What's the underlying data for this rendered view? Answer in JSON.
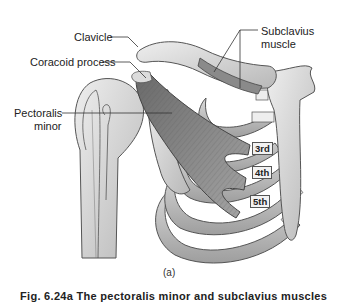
{
  "figure": {
    "labels": {
      "clavicle": "Clavicle",
      "coracoid_process": "Coracoid process",
      "pectoralis_minor_line1": "Pectoralis",
      "pectoralis_minor_line2": "minor",
      "subclavius_line1": "Subclavius",
      "subclavius_line2": "muscle"
    },
    "rib_tags": [
      "3rd",
      "4th",
      "5th"
    ],
    "panel_label": "(a)",
    "caption": "Fig. 6.24a  The pectoralis minor and subclavius muscles",
    "colors": {
      "bone_fill": "#d6d6d6",
      "bone_stroke": "#555555",
      "muscle_fill": "#8a8a8a",
      "muscle_dark": "#5e5e5e",
      "leader_line": "#333333",
      "background": "#ffffff"
    }
  }
}
